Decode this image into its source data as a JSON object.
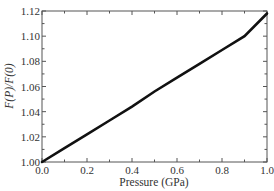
{
  "chart_data": {
    "type": "line",
    "title": "",
    "xlabel": "Pressure (GPa)",
    "ylabel": "F(P)/F(0)",
    "xlim": [
      0.0,
      1.0
    ],
    "ylim": [
      1.0,
      1.12
    ],
    "xticks": [
      "0.0",
      "0.2",
      "0.4",
      "0.6",
      "0.8",
      "1.0"
    ],
    "yticks": [
      "1.00",
      "1.02",
      "1.04",
      "1.06",
      "1.08",
      "1.10",
      "1.12"
    ],
    "grid": false,
    "legend": null,
    "series": [
      {
        "name": "F(P)/F(0)",
        "color": "#111111",
        "x": [
          0.0,
          0.1,
          0.2,
          0.3,
          0.4,
          0.5,
          0.6,
          0.7,
          0.8,
          0.9,
          1.0
        ],
        "y": [
          1.0,
          1.011,
          1.022,
          1.033,
          1.044,
          1.056,
          1.067,
          1.078,
          1.089,
          1.1,
          1.118
        ]
      }
    ]
  }
}
